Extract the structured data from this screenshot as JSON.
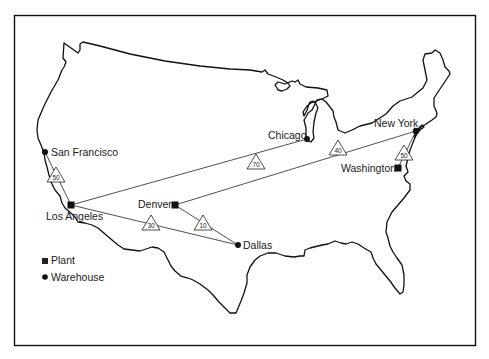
{
  "map": {
    "cities": [
      {
        "id": "san-francisco",
        "name": "San Francisco",
        "type": "warehouse"
      },
      {
        "id": "los-angeles",
        "name": "Los Angeles",
        "type": "plant"
      },
      {
        "id": "denver",
        "name": "Denver",
        "type": "plant"
      },
      {
        "id": "dallas",
        "name": "Dallas",
        "type": "warehouse"
      },
      {
        "id": "chicago",
        "name": "Chicago",
        "type": "warehouse"
      },
      {
        "id": "new-york",
        "name": "New York",
        "type": "warehouse"
      },
      {
        "id": "washington",
        "name": "Washington",
        "type": "plant"
      }
    ],
    "routes": [
      {
        "from": "Los Angeles",
        "to": "San Francisco",
        "value": "50"
      },
      {
        "from": "Los Angeles",
        "to": "Chicago / New York",
        "value": "70"
      },
      {
        "from": "Los Angeles",
        "to": "Dallas",
        "value": "30"
      },
      {
        "from": "Denver",
        "to": "Dallas",
        "value": "10"
      },
      {
        "from": "Denver",
        "to": "New York",
        "value": "40"
      },
      {
        "from": "Washington",
        "to": "New York",
        "value": "50"
      }
    ],
    "legend": {
      "plant_label": "Plant",
      "warehouse_label": "Warehouse"
    }
  }
}
